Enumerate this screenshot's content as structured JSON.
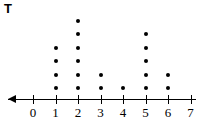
{
  "title": "T",
  "chart_data": {
    "type": "dotplot",
    "title": "T",
    "xlabel": "",
    "ylabel": "",
    "categories": [
      "0",
      "1",
      "2",
      "3",
      "4",
      "5",
      "6",
      "7"
    ],
    "x": [
      0,
      1,
      2,
      3,
      4,
      5,
      6,
      7
    ],
    "values": [
      0,
      4,
      6,
      2,
      1,
      5,
      2,
      0
    ],
    "tick_labels": [
      "0",
      "1",
      "2",
      "3",
      "4",
      "5",
      "6",
      "7"
    ],
    "xlim": [
      0,
      7
    ],
    "grid": false,
    "legend": null,
    "axis_arrow": "left",
    "dot_color": "#000000",
    "axis_color": "#000000",
    "background": "#ffffff",
    "points": [
      {
        "x": 1,
        "count": 4
      },
      {
        "x": 2,
        "count": 6
      },
      {
        "x": 3,
        "count": 2
      },
      {
        "x": 4,
        "count": 1
      },
      {
        "x": 5,
        "count": 5
      },
      {
        "x": 6,
        "count": 2
      }
    ]
  },
  "layout": {
    "axis_y": 99,
    "origin_x": 33,
    "tick_spacing": 22.5,
    "dot_base_y": 88,
    "dot_spacing": 13.4
  }
}
